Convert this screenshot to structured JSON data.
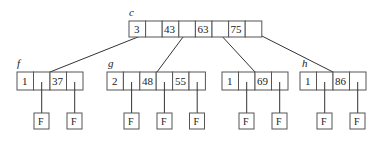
{
  "diagram": {
    "type": "b-tree",
    "root": {
      "label": "c",
      "cells": [
        "3",
        "",
        "43",
        "",
        "63",
        "",
        "75",
        ""
      ]
    },
    "children": [
      {
        "label": "f",
        "cells": [
          "1",
          "",
          "37",
          ""
        ],
        "leaf_pointers": [
          "F",
          "F"
        ]
      },
      {
        "label": "g",
        "cells": [
          "2",
          "",
          "48",
          "",
          "55",
          ""
        ],
        "leaf_pointers": [
          "F",
          "F",
          "F"
        ]
      },
      {
        "label": "",
        "cells": [
          "1",
          "",
          "69",
          ""
        ],
        "leaf_pointers": [
          "F",
          "F"
        ]
      },
      {
        "label": "h",
        "cells": [
          "1",
          "",
          "86",
          ""
        ],
        "leaf_pointers": [
          "F",
          "F"
        ]
      }
    ]
  }
}
